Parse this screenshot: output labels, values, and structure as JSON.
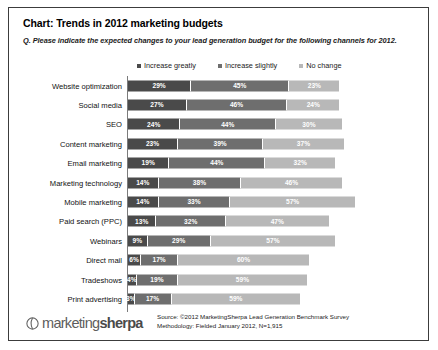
{
  "chart": {
    "title": "Chart: Trends in 2012 marketing budgets",
    "question": "Q. Please indicate the expected changes to your lead generation budget for the following channels for 2012."
  },
  "legend": {
    "items": [
      {
        "label": "Increase greatly",
        "color": "#4a4a4a"
      },
      {
        "label": "Increase slightly",
        "color": "#6e6e6e"
      },
      {
        "label": "No change",
        "color": "#b8b8b8"
      }
    ]
  },
  "footer": {
    "logo_light": "marketing",
    "logo_bold": "sherpa",
    "source_line1": "Source: ©2012 MarketingSherpa Lead Generation Benchmark Survey",
    "source_line2": "Methodology: Fielded January 2012, N=1,915"
  },
  "chart_data": {
    "type": "bar",
    "orientation": "horizontal",
    "stacked": true,
    "title": "Chart: Trends in 2012 marketing budgets",
    "subtitle": "Q. Please indicate the expected changes to your lead generation budget for the following channels for 2012.",
    "xlabel": "",
    "ylabel": "",
    "xlim": [
      0,
      100
    ],
    "grid": false,
    "legend_position": "top",
    "value_suffix": "%",
    "categories": [
      "Website optimization",
      "Social media",
      "SEO",
      "Content marketing",
      "Email marketing",
      "Marketing technology",
      "Mobile marketing",
      "Paid search (PPC)",
      "Webinars",
      "Direct mail",
      "Tradeshows",
      "Print advertising"
    ],
    "series": [
      {
        "name": "Increase greatly",
        "color": "#4a4a4a",
        "values": [
          29,
          27,
          24,
          23,
          19,
          14,
          14,
          13,
          9,
          6,
          4,
          3
        ]
      },
      {
        "name": "Increase slightly",
        "color": "#6e6e6e",
        "values": [
          45,
          46,
          44,
          39,
          44,
          38,
          33,
          32,
          29,
          17,
          19,
          17
        ]
      },
      {
        "name": "No change",
        "color": "#b8b8b8",
        "values": [
          23,
          24,
          30,
          37,
          32,
          46,
          57,
          47,
          57,
          60,
          59,
          59
        ]
      }
    ],
    "rows": [
      {
        "label": "Website optimization",
        "increase_greatly": 29,
        "increase_slightly": 45,
        "no_change": 23
      },
      {
        "label": "Social media",
        "increase_greatly": 27,
        "increase_slightly": 46,
        "no_change": 24
      },
      {
        "label": "SEO",
        "increase_greatly": 24,
        "increase_slightly": 44,
        "no_change": 30
      },
      {
        "label": "Content marketing",
        "increase_greatly": 23,
        "increase_slightly": 39,
        "no_change": 37
      },
      {
        "label": "Email marketing",
        "increase_greatly": 19,
        "increase_slightly": 44,
        "no_change": 32
      },
      {
        "label": "Marketing technology",
        "increase_greatly": 14,
        "increase_slightly": 38,
        "no_change": 46
      },
      {
        "label": "Mobile marketing",
        "increase_greatly": 14,
        "increase_slightly": 33,
        "no_change": 57
      },
      {
        "label": "Paid search (PPC)",
        "increase_greatly": 13,
        "increase_slightly": 32,
        "no_change": 47
      },
      {
        "label": "Webinars",
        "increase_greatly": 9,
        "increase_slightly": 29,
        "no_change": 57
      },
      {
        "label": "Direct mail",
        "increase_greatly": 6,
        "increase_slightly": 17,
        "no_change": 60
      },
      {
        "label": "Tradeshows",
        "increase_greatly": 4,
        "increase_slightly": 19,
        "no_change": 59
      },
      {
        "label": "Print advertising",
        "increase_greatly": 3,
        "increase_slightly": 17,
        "no_change": 59
      }
    ]
  }
}
